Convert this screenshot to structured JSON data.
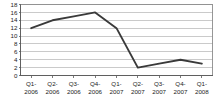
{
  "chart_data": {
    "type": "line",
    "title": "",
    "subtitle": "",
    "xlabel": "",
    "ylabel": "",
    "categories": [
      "Q1-2006",
      "Q2-2006",
      "Q3-2006",
      "Q4-2006",
      "Q1-2007",
      "Q2-2007",
      "Q3-2007",
      "Q4-2007",
      "Q1-2008"
    ],
    "category_lines": [
      [
        "Q1-",
        "2006"
      ],
      [
        "Q2-",
        "2006"
      ],
      [
        "Q3-",
        "2006"
      ],
      [
        "Q4-",
        "2006"
      ],
      [
        "Q1-",
        "2007"
      ],
      [
        "Q2-",
        "2007"
      ],
      [
        "Q3-",
        "2007"
      ],
      [
        "Q4-",
        "2007"
      ],
      [
        "Q1-",
        "2008"
      ]
    ],
    "values": [
      12,
      14,
      15,
      16,
      12,
      2,
      3,
      4,
      3
    ],
    "ylim": [
      0,
      18
    ],
    "ytick_values": [
      0,
      2,
      4,
      6,
      8,
      10,
      12,
      14,
      16,
      18
    ],
    "ytick_labels": [
      "0",
      "2",
      "4",
      "6",
      "8",
      "10",
      "12",
      "14",
      "16",
      "18"
    ],
    "grid": true,
    "grid_axis": "y",
    "legend": false,
    "legend_position": "none",
    "series_color": "#3a3a3a",
    "grid_color": "#b4b4b4",
    "axis_color": "#5a5a5a",
    "background_color": "#ffffff",
    "marker": "none"
  }
}
